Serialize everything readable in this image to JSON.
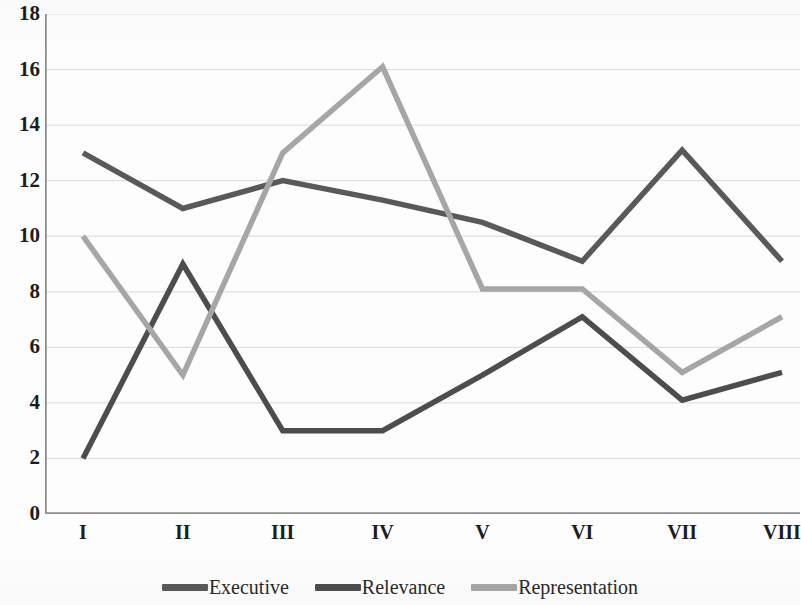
{
  "chart_data": {
    "type": "line",
    "title": "",
    "subtitle": "",
    "xlabel": "",
    "ylabel": "",
    "categories": [
      "I",
      "II",
      "III",
      "IV",
      "V",
      "VI",
      "VII",
      "VIII"
    ],
    "ylim": [
      0,
      18
    ],
    "y_ticks": [
      0,
      2,
      4,
      6,
      8,
      10,
      12,
      14,
      16,
      18
    ],
    "y_tick_labels": [
      "0",
      "2",
      "4",
      "6",
      "8",
      "10",
      "12",
      "14",
      "16",
      "18"
    ],
    "grid": true,
    "grid_axis": "y",
    "legend_position": "bottom",
    "series": [
      {
        "name": "Executive",
        "color": "#595959",
        "values": [
          13.0,
          11.0,
          12.0,
          11.3,
          10.5,
          9.1,
          13.1,
          9.1
        ]
      },
      {
        "name": "Relevance",
        "color": "#4d4d4d",
        "values": [
          2.0,
          9.0,
          3.0,
          3.0,
          5.0,
          7.1,
          4.1,
          5.1
        ]
      },
      {
        "name": "Representation",
        "color": "#a6a6a6",
        "values": [
          10.0,
          5.0,
          13.0,
          16.1,
          8.1,
          8.1,
          5.1,
          7.1
        ]
      }
    ]
  },
  "axes": {
    "axis_line_color": "#8c8c8c",
    "grid_line_color": "#d9d9d9"
  },
  "legend": {
    "items": [
      {
        "label": "Executive",
        "color": "#595959"
      },
      {
        "label": "Relevance",
        "color": "#4d4d4d"
      },
      {
        "label": "Representation",
        "color": "#a6a6a6"
      }
    ]
  }
}
